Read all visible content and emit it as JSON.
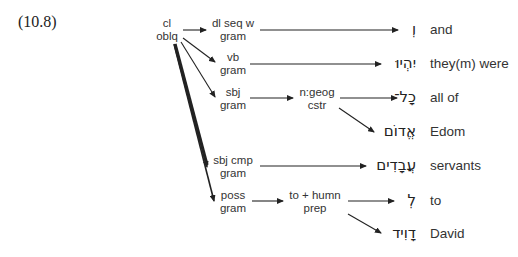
{
  "example_number": "(10.8)",
  "nodes": {
    "root": {
      "line1": "cl",
      "line2": "oblq"
    },
    "dl_seq": {
      "line1": "dl seq w",
      "line2": "gram"
    },
    "vb": {
      "line1": "vb",
      "line2": "gram"
    },
    "sbj": {
      "line1": "sbj",
      "line2": "gram"
    },
    "ngeog": {
      "line1": "n:geog",
      "line2": "cstr"
    },
    "sbj_cmp": {
      "line1": "sbj cmp",
      "line2": "gram"
    },
    "poss": {
      "line1": "poss",
      "line2": "gram"
    },
    "to_humn": {
      "line1": "to + humn",
      "line2": "prep"
    }
  },
  "words": [
    {
      "hebrew": "וְ",
      "gloss": "and"
    },
    {
      "hebrew": "יִהְיוּ",
      "gloss": "they(m) were"
    },
    {
      "hebrew": "כָל־",
      "gloss": "all of"
    },
    {
      "hebrew": "אֱדוֹם",
      "gloss": "Edom"
    },
    {
      "hebrew": "עֲבָדִים",
      "gloss": "servants"
    },
    {
      "hebrew": "לְ",
      "gloss": "to"
    },
    {
      "hebrew": "דָוִיד",
      "gloss": "David"
    }
  ],
  "colors": {
    "line": "#222222",
    "text": "#333333"
  }
}
